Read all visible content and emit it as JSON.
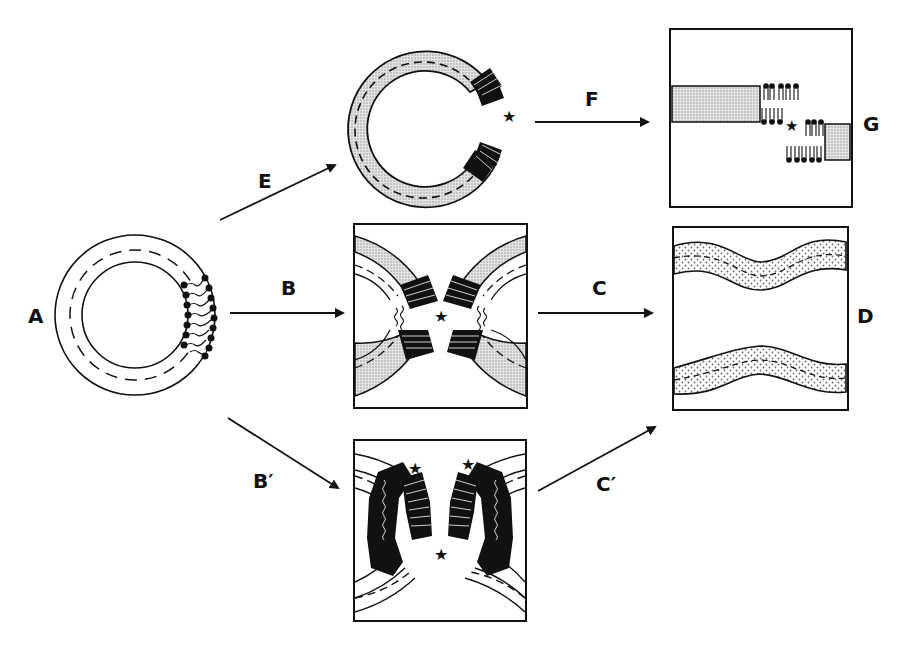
{
  "figure": {
    "labels": {
      "A": "A",
      "B": "B",
      "B_prime": "B′",
      "C": "C",
      "C_prime": "C′",
      "D": "D",
      "E": "E",
      "F": "F",
      "G": "G"
    },
    "stages": [
      {
        "id": "A",
        "description": "intact vesicle with lipid patch"
      },
      {
        "id": "E_result",
        "description": "opened ring (C-shape) with lipid edges and star"
      },
      {
        "id": "G",
        "description": "flattened bilayer sheets with offset lipid edges and star"
      },
      {
        "id": "B_result",
        "description": "two facing curved membrane fragments with lipid edges and star"
      },
      {
        "id": "D",
        "description": "two wavy parallel membrane bands"
      },
      {
        "id": "B_prime_result",
        "description": "two facing curved membranes with lipids and three stars"
      }
    ],
    "arrows": [
      "E",
      "F",
      "B",
      "C",
      "B′",
      "C′"
    ],
    "colors": {
      "ink": "#111111",
      "shade": "#c8c8c8",
      "dots": "#d8d8d8"
    }
  }
}
